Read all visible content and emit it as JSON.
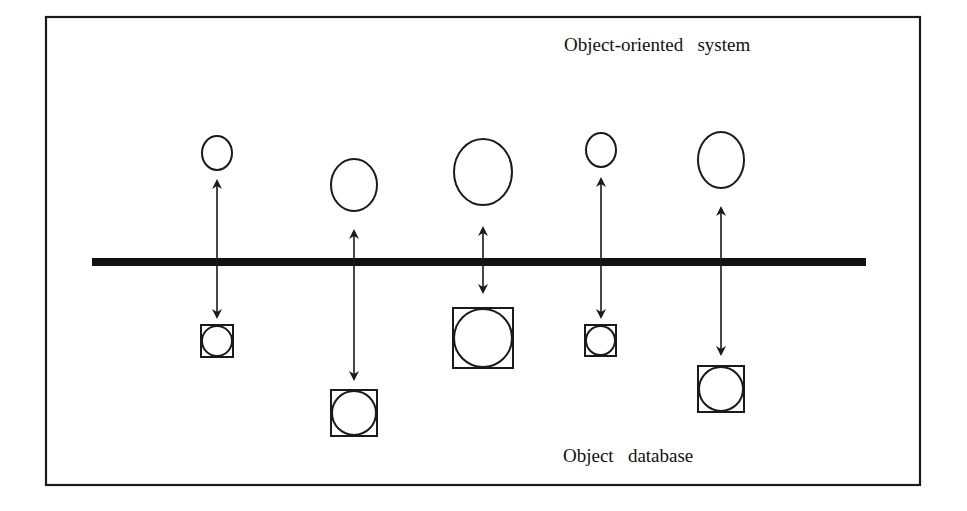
{
  "diagram": {
    "title_top": "Object-oriented   system",
    "title_bottom": "Object   database",
    "divider_label": "",
    "mappings": [
      {
        "id": "obj-1",
        "object_size": "small",
        "db_size": "small",
        "db_depth": "near"
      },
      {
        "id": "obj-2",
        "object_size": "medium",
        "db_size": "medium",
        "db_depth": "far"
      },
      {
        "id": "obj-3",
        "object_size": "large",
        "db_size": "large",
        "db_depth": "near"
      },
      {
        "id": "obj-4",
        "object_size": "small",
        "db_size": "small",
        "db_depth": "near"
      },
      {
        "id": "obj-5",
        "object_size": "medium",
        "db_size": "medium",
        "db_depth": "far"
      }
    ],
    "colors": {
      "ink": "#1a1a1a",
      "background": "#ffffff"
    }
  }
}
